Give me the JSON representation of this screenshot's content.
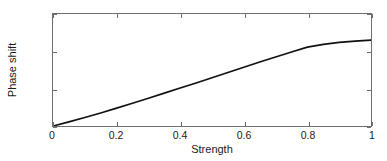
{
  "chart_data": {
    "type": "line",
    "title": "",
    "xlabel": "Strength",
    "ylabel": "Phase shift",
    "xlim": [
      0,
      1
    ],
    "ylim": [
      0,
      1.5
    ],
    "grid": false,
    "legend": null,
    "xticks": [
      0,
      0.2,
      0.4,
      0.6,
      0.8,
      1
    ],
    "xticklabels": [
      "0",
      "0.2",
      "0.4",
      "0.6",
      "0.8",
      "1"
    ],
    "yticks": [
      0,
      0.5,
      1,
      1.5
    ],
    "yticklabels": [
      "0",
      "0.5",
      "1",
      "1.5"
    ],
    "line_color": "#111111",
    "axis_color": "#6e6e6e",
    "background": "#ffffff",
    "series": [
      {
        "name": "phase shift",
        "x": [
          0.0,
          0.05,
          0.1,
          0.15,
          0.2,
          0.25,
          0.3,
          0.35,
          0.4,
          0.45,
          0.5,
          0.55,
          0.6,
          0.65,
          0.7,
          0.75,
          0.8,
          0.85,
          0.9,
          0.95,
          1.0
        ],
        "y": [
          0.0,
          0.055,
          0.113,
          0.175,
          0.24,
          0.305,
          0.372,
          0.44,
          0.508,
          0.577,
          0.647,
          0.717,
          0.787,
          0.856,
          0.925,
          0.992,
          1.056,
          1.094,
          1.119,
          1.136,
          1.15
        ]
      }
    ]
  },
  "axes": {
    "xlabel": "Strength",
    "ylabel": "Phase shift"
  }
}
